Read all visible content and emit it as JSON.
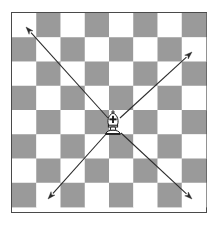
{
  "figure": {
    "title": "Chessboard with bishop movement diagram"
  },
  "board": {
    "name": "chessboard",
    "files": 8,
    "ranks": 8,
    "light_square_color": "#ffffff",
    "dark_square_color": "#9a9a9a",
    "border_color": "#4a4a4a",
    "top_left_square_color": "light",
    "left_px": 11,
    "top_px": 12,
    "size_px": 196,
    "square_px": 24.4
  },
  "pieces": [
    {
      "name": "bishop",
      "glyph": "♗",
      "color": "white",
      "square_color": "light",
      "center_x": 113,
      "center_y": 124
    }
  ],
  "arrows": [
    {
      "name": "arrow-up-left",
      "direction": "up-left",
      "from_x": 108,
      "from_y": 118,
      "to_x": 26,
      "to_y": 27
    },
    {
      "name": "arrow-up-right",
      "direction": "up-right",
      "from_x": 120,
      "from_y": 118,
      "to_x": 192,
      "to_y": 52
    },
    {
      "name": "arrow-down-left",
      "direction": "down-left",
      "from_x": 107,
      "from_y": 133,
      "to_x": 48,
      "to_y": 199
    },
    {
      "name": "arrow-down-right",
      "direction": "down-right",
      "from_x": 121,
      "from_y": 133,
      "to_x": 192,
      "to_y": 199
    }
  ],
  "colors": {
    "arrow": "#2b2b2b",
    "piece_outline": "#1c1c1c",
    "background": "#ffffff"
  }
}
